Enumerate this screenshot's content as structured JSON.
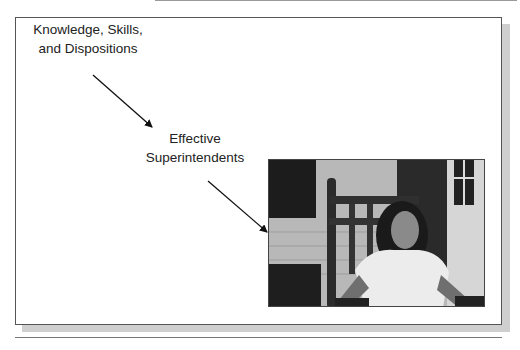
{
  "diagram": {
    "nodes": [
      {
        "id": "ksd",
        "label_line1": "Knowledge, Skills,",
        "label_line2": "and Dispositions"
      },
      {
        "id": "es",
        "label_line1": "Effective",
        "label_line2": "Superintendents"
      }
    ],
    "edges": [
      {
        "from": "ksd",
        "to": "es"
      },
      {
        "from": "es",
        "to": "photo"
      }
    ],
    "photo": {
      "description": "Grayscale photo of a girl sitting in a wooden rocking chair on a porch"
    }
  }
}
